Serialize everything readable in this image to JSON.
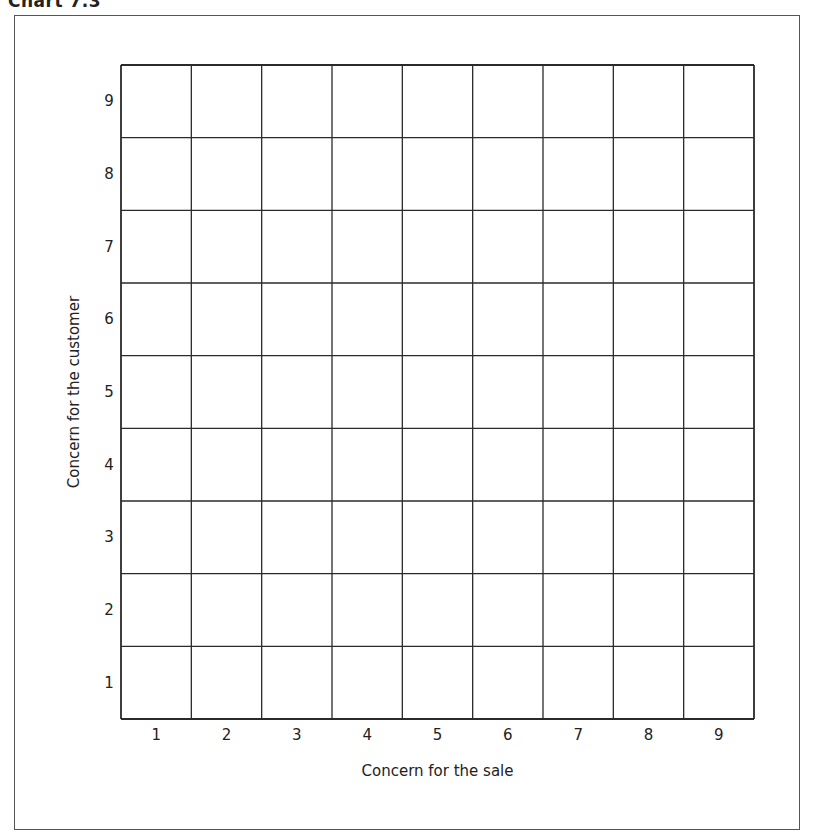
{
  "chart_data": {
    "type": "heatmap",
    "title": "Chart 7.3",
    "xlabel": "Concern for the sale",
    "ylabel": "Concern for the customer",
    "x_categories": [
      "1",
      "2",
      "3",
      "4",
      "5",
      "6",
      "7",
      "8",
      "9"
    ],
    "y_categories": [
      "1",
      "2",
      "3",
      "4",
      "5",
      "6",
      "7",
      "8",
      "9"
    ],
    "xlim": [
      1,
      9
    ],
    "ylim": [
      1,
      9
    ],
    "grid": true,
    "grid_rows": 9,
    "grid_cols": 9,
    "values": [],
    "legend": null
  },
  "colors": {
    "grid_line": "#2a2a2a",
    "frame": "#555555",
    "background": "#ffffff",
    "text": "#222222"
  }
}
